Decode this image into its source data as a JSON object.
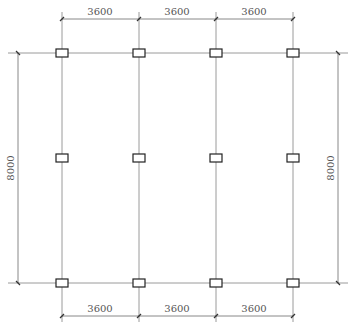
{
  "drawing": {
    "type": "structural column grid plan",
    "columns_x": [
      62,
      139,
      216,
      293
    ],
    "rows_y": [
      53,
      158,
      283
    ],
    "top_dimensions": [
      "3600",
      "3600",
      "3600"
    ],
    "bottom_dimensions": [
      "3600",
      "3600",
      "3600"
    ],
    "left_dimension": "8000",
    "right_dimension": "8000",
    "line_color": "#9a9a9a",
    "column_outline_color": "#222222"
  }
}
